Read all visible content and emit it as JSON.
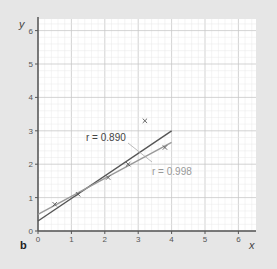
{
  "panel_label": "b",
  "chart_data": {
    "type": "scatter",
    "title": "",
    "xlabel": "x",
    "ylabel": "y",
    "xlim": [
      0,
      6.5
    ],
    "ylim": [
      0,
      6.3
    ],
    "xticks": [
      0,
      1,
      2,
      3,
      4,
      5,
      6
    ],
    "yticks": [
      0,
      1,
      2,
      3,
      4,
      5,
      6
    ],
    "grid": true,
    "points": [
      {
        "x": 0.5,
        "y": 0.8
      },
      {
        "x": 1.2,
        "y": 1.1
      },
      {
        "x": 2.1,
        "y": 1.6
      },
      {
        "x": 2.7,
        "y": 2.0
      },
      {
        "x": 3.2,
        "y": 3.3
      },
      {
        "x": 3.8,
        "y": 2.5
      }
    ],
    "lines": [
      {
        "name": "r = 0.890",
        "label": "r = 0.890",
        "x": [
          0,
          4
        ],
        "y": [
          0.3,
          3.0
        ],
        "color": "#555555"
      },
      {
        "name": "r = 0.998",
        "label": "r = 0.998",
        "x": [
          0,
          4
        ],
        "y": [
          0.5,
          2.65
        ],
        "color": "#999999"
      }
    ],
    "annotations": [
      "r = 0.890",
      "r = 0.998"
    ]
  },
  "colors": {
    "background": "#e6e6e6",
    "plot_bg": "#ffffff",
    "grid_major": "#c8c8c8",
    "grid_minor": "#e8e8e8",
    "axis": "#555555"
  }
}
